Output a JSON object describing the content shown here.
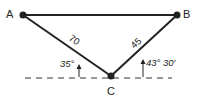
{
  "diagram": {
    "type": "geometry-triangle",
    "points": {
      "A": {
        "label": "A",
        "x": 23,
        "y": 15
      },
      "B": {
        "label": "B",
        "x": 177,
        "y": 15
      },
      "C": {
        "label": "C",
        "x": 111,
        "y": 76
      }
    },
    "segments": [
      {
        "from": "A",
        "to": "B",
        "label": ""
      },
      {
        "from": "A",
        "to": "C",
        "label": "70"
      },
      {
        "from": "C",
        "to": "B",
        "label": "45"
      }
    ],
    "reference_line": {
      "style": "dashed",
      "y": 78,
      "x1": 25,
      "x2": 172
    },
    "angles": [
      {
        "at": "C",
        "side": "left",
        "label": "35°"
      },
      {
        "at": "C",
        "side": "right",
        "label": "43° 30′"
      }
    ],
    "colors": {
      "line": "#222222",
      "background": "#ffffff"
    }
  }
}
